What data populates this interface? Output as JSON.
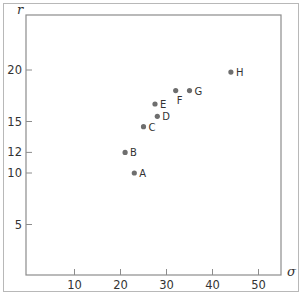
{
  "chart_data": {
    "type": "scatter",
    "title": "",
    "xlabel": "σ",
    "ylabel": "r",
    "xlim": [
      0,
      55
    ],
    "ylim": [
      0,
      22.5
    ],
    "x_ticks": [
      10,
      20,
      30,
      40,
      50
    ],
    "y_ticks": [
      5,
      10,
      12,
      15,
      20
    ],
    "grid": false,
    "legend": null,
    "point_color": "#6e6e6e",
    "series": [
      {
        "name": "points",
        "points": [
          {
            "label": "A",
            "x": 23,
            "y": 10
          },
          {
            "label": "B",
            "x": 21,
            "y": 12
          },
          {
            "label": "C",
            "x": 25,
            "y": 14.5
          },
          {
            "label": "D",
            "x": 28,
            "y": 15.5
          },
          {
            "label": "E",
            "x": 27.5,
            "y": 16.7
          },
          {
            "label": "F",
            "x": 32,
            "y": 18
          },
          {
            "label": "G",
            "x": 35,
            "y": 18
          },
          {
            "label": "H",
            "x": 44,
            "y": 19.8
          }
        ]
      }
    ]
  }
}
